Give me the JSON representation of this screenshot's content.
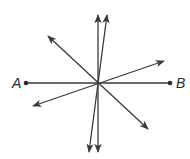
{
  "diagram": {
    "stroke_color": "#3a3a3a",
    "center": {
      "x": 98,
      "y": 83
    },
    "points": [
      {
        "id": "A",
        "label": "A",
        "x": 26,
        "y": 83,
        "label_x": 12,
        "label_y": 88
      },
      {
        "id": "B",
        "label": "B",
        "x": 170,
        "y": 83,
        "label_x": 176,
        "label_y": 88
      }
    ],
    "segment_AB": {
      "from": "A",
      "to": "B"
    },
    "lines": [
      {
        "name": "vertical-line",
        "x1": 98,
        "y1": 152,
        "x2": 98,
        "y2": 15,
        "arrows": "both"
      },
      {
        "name": "steep-line",
        "x1": 89,
        "y1": 152,
        "x2": 107,
        "y2": 15,
        "arrows": "both"
      },
      {
        "name": "diagonal-line-nw-se",
        "x1": 48,
        "y1": 36,
        "x2": 148,
        "y2": 129,
        "arrows": "both"
      },
      {
        "name": "shallow-line-sw-ne",
        "x1": 33,
        "y1": 106,
        "x2": 164,
        "y2": 61,
        "arrows": "both"
      }
    ]
  }
}
